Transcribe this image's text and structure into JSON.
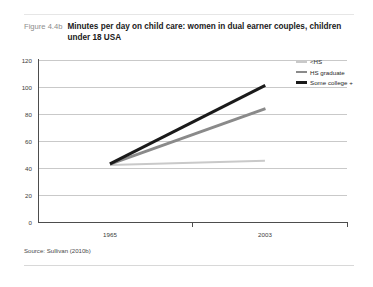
{
  "figure": {
    "number": "Figure 4.4b",
    "title": "Minutes per day on child care: women in dual earner couples, children under 18 USA",
    "source": "Source: Sullivan (2010b)"
  },
  "chart_data": {
    "type": "line",
    "title": "Minutes per day on child care: women in dual earner couples, children under 18 USA",
    "xlabel": "",
    "ylabel": "",
    "x": [
      "1965",
      "2003"
    ],
    "categories": [
      "1965",
      "2003"
    ],
    "series": [
      {
        "name": "<HS",
        "values": [
          42,
          45
        ],
        "color": "#c9c9c9",
        "width": 2.2
      },
      {
        "name": "HS graduate",
        "values": [
          43,
          84
        ],
        "color": "#8a8a8a",
        "width": 2.6
      },
      {
        "name": "Some college +",
        "values": [
          43,
          101
        ],
        "color": "#1a1a1a",
        "width": 3.2
      }
    ],
    "ylim": [
      0,
      120
    ],
    "yticks": [
      0,
      20,
      40,
      60,
      80,
      100,
      120
    ],
    "ytick_labels": [
      "0",
      "20",
      "40",
      "60",
      "80",
      "100",
      "120"
    ],
    "xtick_labels": [
      "1965",
      "2003"
    ],
    "grid": true,
    "legend_position": "top-right"
  },
  "legend": {
    "items": [
      {
        "label": "<HS",
        "color": "#c9c9c9",
        "thickness": "2px"
      },
      {
        "label": "HS graduate",
        "color": "#8a8a8a",
        "thickness": "2.6px"
      },
      {
        "label": "Some college +",
        "color": "#1a1a1a",
        "thickness": "3.2px"
      }
    ]
  },
  "axes": {
    "y_tick_labels": [
      "120",
      "100",
      "80",
      "60",
      "40",
      "20",
      "0"
    ],
    "x_tick_labels": [
      "1965",
      "2003"
    ]
  }
}
